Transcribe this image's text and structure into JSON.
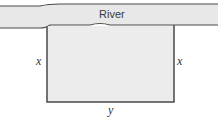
{
  "diagram": {
    "type": "fenced-field-along-river",
    "river": {
      "label": "River",
      "fill_color": "#e8e8e8",
      "edge_color": "#4a4a4a"
    },
    "field": {
      "fill_color": "#ececec",
      "border_color": "#4a4a4a",
      "side_labels": {
        "left": "x",
        "right": "x",
        "bottom": "y"
      }
    }
  }
}
